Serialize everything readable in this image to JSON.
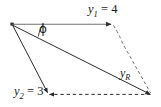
{
  "figure": {
    "background_color": "#ffffff",
    "line_color": "#2b2b2b",
    "labels": {
      "y1": {
        "symbol": "y",
        "subscript": "1",
        "equals": " = ",
        "value": "4",
        "text": "y1 = 4"
      },
      "y2": {
        "symbol": "y",
        "subscript": "2",
        "equals": " = ",
        "value": "3",
        "text": "y2 = 3"
      },
      "yr": {
        "symbol": "y",
        "subscript": "R",
        "text": "yR"
      },
      "phi": {
        "symbol": "ϕ",
        "text": "ϕ"
      }
    },
    "vectors": [
      {
        "name": "y1",
        "magnitude": 4,
        "style": "solid",
        "arrow": true,
        "direction": "right-horizontal"
      },
      {
        "name": "y2",
        "magnitude": 3,
        "style": "solid",
        "arrow": true,
        "direction": "down-right-steep"
      },
      {
        "name": "yR",
        "style": "solid",
        "arrow": true,
        "direction": "down-right-shallow"
      }
    ],
    "construction_lines": [
      {
        "name": "parallel-to-y2",
        "style": "dashed",
        "from": "y1-tip",
        "to": "resultant-tip"
      },
      {
        "name": "parallel-to-y1",
        "style": "dashed",
        "from": "y2-tip",
        "to": "resultant-tip",
        "arrow": true
      }
    ]
  }
}
